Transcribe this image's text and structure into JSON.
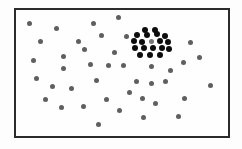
{
  "figure": {
    "canvas": {
      "width": 242,
      "height": 149,
      "background": "#fdfdfd"
    },
    "frame": {
      "x": 14,
      "y": 8,
      "width": 216,
      "height": 130,
      "border_width": 2,
      "border_color": "#2b2b2b",
      "fill_color": "#fefefe"
    },
    "dot_style": {
      "scattered_color": "#5f5f5f",
      "scattered_diameter": 5,
      "clustered_color": "#0d0d0d",
      "clustered_diameter": 6,
      "cluster_center_color": "#787878"
    }
  },
  "chart_data": {
    "type": "scatter",
    "subtitle": "",
    "xlabel": "",
    "ylabel": "",
    "xlim": [
      14,
      230
    ],
    "ylim": [
      8,
      138
    ],
    "grid": false,
    "legend": "none",
    "annotations": [],
    "tick_labels": {
      "x": [],
      "y": []
    },
    "series": [
      {
        "name": "scattered-points",
        "color": "#5f5f5f",
        "marker": "circle",
        "marker_size": 5,
        "count": 41,
        "points": [
          {
            "x": 29,
            "y": 23
          },
          {
            "x": 56,
            "y": 28
          },
          {
            "x": 93,
            "y": 23
          },
          {
            "x": 118,
            "y": 17
          },
          {
            "x": 126,
            "y": 36
          },
          {
            "x": 40,
            "y": 41
          },
          {
            "x": 78,
            "y": 41
          },
          {
            "x": 101,
            "y": 35
          },
          {
            "x": 190,
            "y": 42
          },
          {
            "x": 33,
            "y": 60
          },
          {
            "x": 63,
            "y": 56
          },
          {
            "x": 84,
            "y": 49
          },
          {
            "x": 114,
            "y": 52
          },
          {
            "x": 108,
            "y": 65
          },
          {
            "x": 183,
            "y": 62
          },
          {
            "x": 36,
            "y": 78
          },
          {
            "x": 52,
            "y": 86
          },
          {
            "x": 71,
            "y": 88
          },
          {
            "x": 96,
            "y": 80
          },
          {
            "x": 123,
            "y": 65
          },
          {
            "x": 136,
            "y": 81
          },
          {
            "x": 151,
            "y": 83
          },
          {
            "x": 165,
            "y": 81
          },
          {
            "x": 210,
            "y": 85
          },
          {
            "x": 63,
            "y": 68
          },
          {
            "x": 61,
            "y": 107
          },
          {
            "x": 83,
            "y": 106
          },
          {
            "x": 106,
            "y": 99
          },
          {
            "x": 119,
            "y": 110
          },
          {
            "x": 142,
            "y": 98
          },
          {
            "x": 155,
            "y": 103
          },
          {
            "x": 184,
            "y": 98
          },
          {
            "x": 98,
            "y": 124
          },
          {
            "x": 143,
            "y": 117
          },
          {
            "x": 178,
            "y": 116
          },
          {
            "x": 129,
            "y": 92
          },
          {
            "x": 170,
            "y": 70
          },
          {
            "x": 199,
            "y": 57
          },
          {
            "x": 45,
            "y": 99
          },
          {
            "x": 90,
            "y": 64
          },
          {
            "x": 151,
            "y": 66
          }
        ]
      },
      {
        "name": "dense-cluster-points",
        "color": "#0d0d0d",
        "marker": "circle",
        "marker_size": 6,
        "count": 18,
        "points": [
          {
            "x": 145,
            "y": 30
          },
          {
            "x": 155,
            "y": 30
          },
          {
            "x": 137,
            "y": 35
          },
          {
            "x": 147,
            "y": 35
          },
          {
            "x": 157,
            "y": 34
          },
          {
            "x": 165,
            "y": 36
          },
          {
            "x": 134,
            "y": 41
          },
          {
            "x": 142,
            "y": 42
          },
          {
            "x": 160,
            "y": 41
          },
          {
            "x": 168,
            "y": 42
          },
          {
            "x": 135,
            "y": 48
          },
          {
            "x": 144,
            "y": 48
          },
          {
            "x": 153,
            "y": 48
          },
          {
            "x": 162,
            "y": 48
          },
          {
            "x": 169,
            "y": 49
          },
          {
            "x": 140,
            "y": 55
          },
          {
            "x": 150,
            "y": 55
          },
          {
            "x": 160,
            "y": 55
          }
        ]
      },
      {
        "name": "cluster-center-point",
        "color": "#787878",
        "marker": "circle",
        "marker_size": 5,
        "count": 1,
        "points": [
          {
            "x": 151,
            "y": 41
          }
        ]
      }
    ]
  }
}
